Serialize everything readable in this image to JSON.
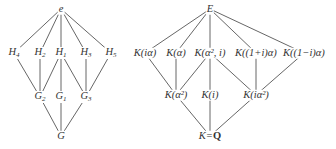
{
  "diagrams": [
    {
      "name": "galois-group-lattice",
      "nodes": [
        {
          "id": "e",
          "label": "e",
          "x": 61,
          "y": 9
        },
        {
          "id": "H4",
          "label": "H",
          "sub": "4",
          "x": 14,
          "y": 53
        },
        {
          "id": "H2",
          "label": "H",
          "sub": "2",
          "x": 40,
          "y": 53
        },
        {
          "id": "H1",
          "label": "H",
          "sub": "1",
          "x": 61,
          "y": 53
        },
        {
          "id": "H3",
          "label": "H",
          "sub": "3",
          "x": 86,
          "y": 53
        },
        {
          "id": "H5",
          "label": "H",
          "sub": "5",
          "x": 111,
          "y": 53
        },
        {
          "id": "G2",
          "label": "G",
          "sub": "2",
          "x": 40,
          "y": 97
        },
        {
          "id": "G1",
          "label": "G",
          "sub": "1",
          "x": 61,
          "y": 97
        },
        {
          "id": "G3",
          "label": "G",
          "sub": "3",
          "x": 86,
          "y": 97
        },
        {
          "id": "G",
          "label": "G",
          "x": 61,
          "y": 136
        }
      ],
      "edges": [
        [
          "e",
          "H4"
        ],
        [
          "e",
          "H2"
        ],
        [
          "e",
          "H1"
        ],
        [
          "e",
          "H3"
        ],
        [
          "e",
          "H5"
        ],
        [
          "H4",
          "G2"
        ],
        [
          "H2",
          "G2"
        ],
        [
          "H1",
          "G2"
        ],
        [
          "H1",
          "G1"
        ],
        [
          "H1",
          "G3"
        ],
        [
          "H3",
          "G3"
        ],
        [
          "H5",
          "G3"
        ],
        [
          "G2",
          "G"
        ],
        [
          "G1",
          "G"
        ],
        [
          "G3",
          "G"
        ]
      ]
    },
    {
      "name": "field-lattice",
      "nodes": [
        {
          "id": "E",
          "label": "E",
          "x": 210,
          "y": 9
        },
        {
          "id": "Kia",
          "label": "K(iα)",
          "x": 145,
          "y": 53
        },
        {
          "id": "Ka",
          "label": "K(α)",
          "x": 176,
          "y": 53
        },
        {
          "id": "Ka2i",
          "label": "K(α², i)",
          "x": 210,
          "y": 53
        },
        {
          "id": "K1pi",
          "label": "K((1+i)α)",
          "x": 256,
          "y": 53
        },
        {
          "id": "K1mi",
          "label": "K((1−i)α)",
          "x": 304,
          "y": 53
        },
        {
          "id": "Ka2",
          "label": "K(α²)",
          "x": 176,
          "y": 95
        },
        {
          "id": "Ki",
          "label": "K(i)",
          "x": 210,
          "y": 95
        },
        {
          "id": "Kia2",
          "label": "K(iα²)",
          "x": 256,
          "y": 95
        },
        {
          "id": "KQ",
          "label": "K=",
          "bold": "Q",
          "x": 210,
          "y": 136
        }
      ],
      "edges": [
        [
          "E",
          "Kia"
        ],
        [
          "E",
          "Ka"
        ],
        [
          "E",
          "Ka2i"
        ],
        [
          "E",
          "K1pi"
        ],
        [
          "E",
          "K1mi"
        ],
        [
          "Kia",
          "Ka2"
        ],
        [
          "Ka",
          "Ka2"
        ],
        [
          "Ka2i",
          "Ka2"
        ],
        [
          "Ka2i",
          "Ki"
        ],
        [
          "Ka2i",
          "Kia2"
        ],
        [
          "K1pi",
          "Kia2"
        ],
        [
          "K1mi",
          "Kia2"
        ],
        [
          "Ka2",
          "KQ"
        ],
        [
          "Ki",
          "KQ"
        ],
        [
          "Kia2",
          "KQ"
        ]
      ]
    }
  ],
  "style": {
    "line_color": "#555555",
    "text_color": "#333333"
  }
}
